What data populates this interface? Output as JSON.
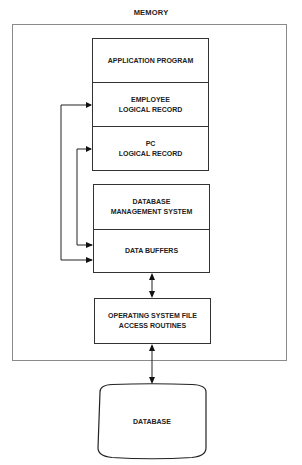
{
  "diagram": {
    "container_label": "MEMORY",
    "stack_top": {
      "segments": [
        {
          "line1": "APPLICATION PROGRAM",
          "line2": ""
        },
        {
          "line1": "EMPLOYEE",
          "line2": "LOGICAL RECORD"
        },
        {
          "line1": "PC",
          "line2": "LOGICAL RECORD"
        }
      ]
    },
    "stack_middle": {
      "segments": [
        {
          "line1": "DATABASE",
          "line2": "MANAGEMENT SYSTEM"
        },
        {
          "line1": "DATA BUFFERS",
          "line2": ""
        }
      ]
    },
    "os_box": {
      "line1": "OPERATING SYSTEM FILE",
      "line2": "ACCESS ROUTINES"
    },
    "database": {
      "label": "DATABASE"
    },
    "connections": [
      {
        "from": "DATA BUFFERS",
        "to": "EMPLOYEE LOGICAL RECORD",
        "type": "arrow"
      },
      {
        "from": "DATA BUFFERS",
        "to": "PC LOGICAL RECORD",
        "type": "arrow"
      },
      {
        "from": "DATA BUFFERS",
        "to": "OPERATING SYSTEM FILE ACCESS ROUTINES",
        "type": "bidirectional"
      },
      {
        "from": "OPERATING SYSTEM FILE ACCESS ROUTINES",
        "to": "DATABASE",
        "type": "bidirectional"
      }
    ]
  }
}
